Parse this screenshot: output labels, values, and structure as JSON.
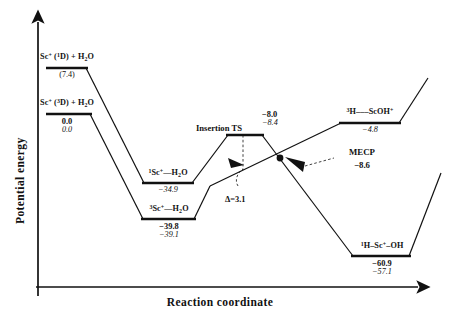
{
  "axes": {
    "ylabel": "Potential energy",
    "xlabel": "Reaction coordinate"
  },
  "annotations": {
    "mecp_label": "MECP",
    "mecp_value": "−8.6",
    "delta_label": "Δ=3.1",
    "ts_label": "Insertion TS",
    "ts_value_bold": "−8.0",
    "ts_value_ital": "−8.4"
  },
  "states": {
    "singlet_reactant": {
      "name_html": "Sc<sup>+</sup> (<sup>1</sup>D) + H<sub>2</sub>O",
      "value_plain": "(7.4)"
    },
    "triplet_reactant": {
      "name_html": "Sc<sup>+</sup> (<sup>3</sup>D) + H<sub>2</sub>O",
      "value_bold": "0.0",
      "value_ital": "0.0"
    },
    "singlet_complex": {
      "name_html": "<sup>1</sup>Sc<sup>+</sup>—H<sub>2</sub>O",
      "value_ital": "−34.9"
    },
    "triplet_complex": {
      "name_html": "<sup>3</sup>Sc<sup>+</sup>—H<sub>2</sub>O",
      "value_bold": "−39.8",
      "value_ital": "−39.1"
    },
    "triplet_product": {
      "name_html": "<sup>3</sup>H–––ScOH<sup>+</sup>",
      "value_ital": "−4.8"
    },
    "singlet_insertion": {
      "name_html": "<sup>1</sup>H–Sc<sup>+</sup>–OH",
      "value_bold": "−60.9",
      "value_ital": "−57.1"
    }
  },
  "chart_data": {
    "type": "line",
    "title": "",
    "xlabel": "Reaction coordinate",
    "ylabel": "Potential energy",
    "grid": false,
    "legend": null,
    "units": "kcal/mol",
    "series": [
      {
        "name": "singlet surface",
        "points": [
          {
            "label": "Sc+ (1D) + H2O",
            "energy_bold": null,
            "energy_ital": null,
            "energy_paren": 7.4
          },
          {
            "label": "1Sc+---H2O",
            "energy_bold": null,
            "energy_ital": -34.9
          },
          {
            "label": "Insertion TS",
            "energy_bold": -8.0,
            "energy_ital": -8.4
          },
          {
            "label": "1H-Sc+-OH",
            "energy_bold": -60.9,
            "energy_ital": -57.1
          }
        ]
      },
      {
        "name": "triplet surface",
        "points": [
          {
            "label": "Sc+ (3D) + H2O",
            "energy_bold": 0.0,
            "energy_ital": 0.0
          },
          {
            "label": "3Sc+---H2O",
            "energy_bold": -39.8,
            "energy_ital": -39.1
          },
          {
            "label": "3H---ScOH+",
            "energy_bold": null,
            "energy_ital": -4.8
          }
        ]
      }
    ],
    "crossing_point": {
      "label": "MECP",
      "energy_bold": -8.6
    },
    "barrier_gap": {
      "label": "Δ",
      "value": 3.1
    }
  }
}
